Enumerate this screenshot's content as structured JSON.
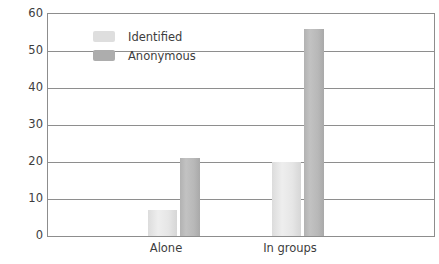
{
  "chart_data": {
    "type": "bar",
    "title": "",
    "subtitle": "",
    "xlabel": "",
    "ylabel": "",
    "categories": [
      "Alone",
      "In groups"
    ],
    "series": [
      {
        "name": "Identified",
        "values": [
          7,
          20
        ],
        "color": "#e0e0e0"
      },
      {
        "name": "Anonymous",
        "values": [
          21,
          56
        ],
        "color": "#b4b4b4"
      }
    ],
    "ylim": [
      0,
      60
    ],
    "yticks": [
      0,
      10,
      20,
      30,
      40,
      50,
      60
    ],
    "ytick_labels": [
      "0",
      "10",
      "20",
      "30",
      "40",
      "50",
      "60"
    ],
    "grid": true,
    "grid_axis": "y",
    "legend_position": "upper-left-inside"
  },
  "axis": {
    "y_ticks": [
      {
        "label": "60",
        "value": 60
      },
      {
        "label": "50",
        "value": 50
      },
      {
        "label": "40",
        "value": 40
      },
      {
        "label": "30",
        "value": 30
      },
      {
        "label": "20",
        "value": 20
      },
      {
        "label": "10",
        "value": 10
      },
      {
        "label": "0",
        "value": 0
      }
    ],
    "x_ticks": [
      {
        "label": "Alone"
      },
      {
        "label": "In groups"
      }
    ]
  },
  "legend": {
    "items": [
      {
        "label": "Identified",
        "swatch": "light-gray"
      },
      {
        "label": "Anonymous",
        "swatch": "medium-gray"
      }
    ]
  },
  "colors": {
    "identified": "#e0e0e0",
    "anonymous": "#b4b4b4",
    "gridline": "#8e8e8e",
    "border": "#8d8d8d",
    "text": "#3d3d3d",
    "background": "#ffffff"
  }
}
